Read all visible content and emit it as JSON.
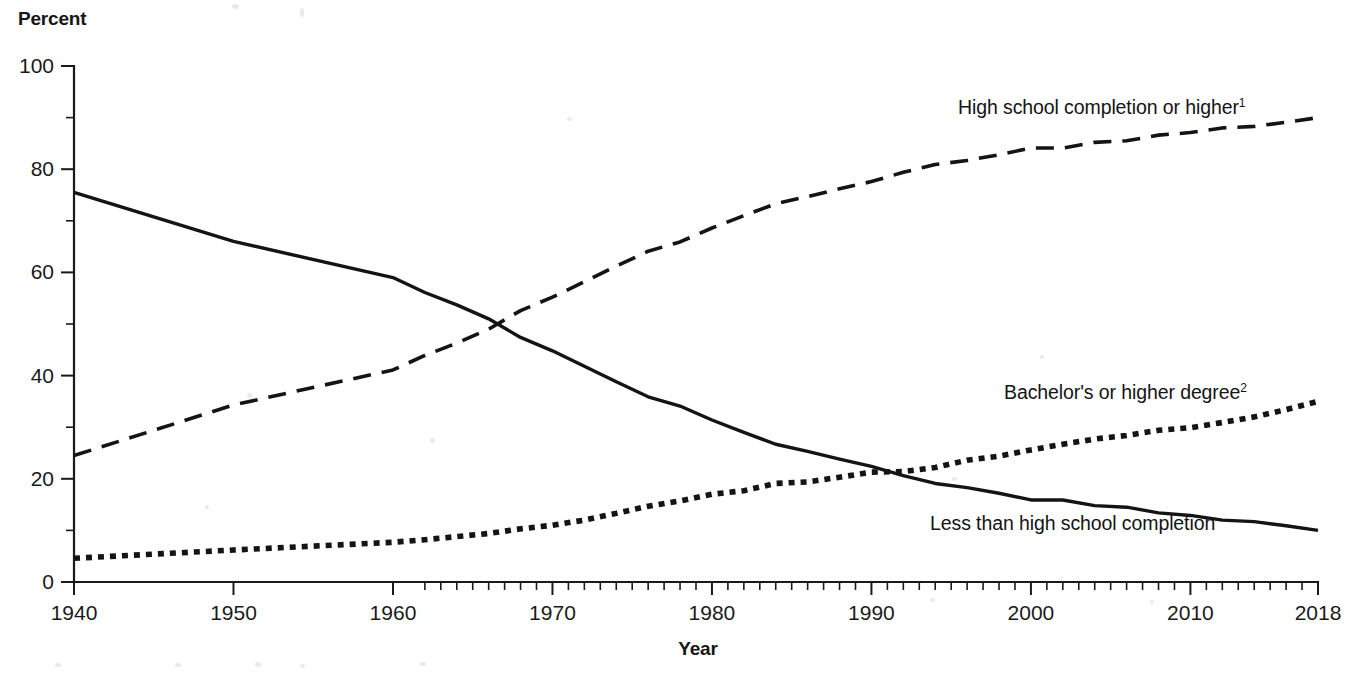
{
  "chart": {
    "type": "line",
    "title": "",
    "ylabel": "Percent",
    "xlabel": "Year",
    "ylim": [
      0,
      100
    ],
    "xlim": [
      1940,
      2018
    ],
    "grid": false,
    "legend_position": "inline-annotations",
    "y_ticks_major": [
      0,
      20,
      40,
      60,
      80,
      100
    ],
    "y_ticks_minor": [
      10,
      30,
      50,
      70,
      90
    ],
    "x_ticks_labeled": [
      1940,
      1950,
      1960,
      1970,
      1980,
      1990,
      2000,
      2010,
      2018
    ],
    "x_tick_note": "decennial ticks 1940-1960, annual ticks 1962-2018"
  },
  "axis_labels": {
    "y_title": "Percent",
    "x_title": "Year",
    "y_tick_text": [
      "100",
      "80",
      "60",
      "40",
      "20",
      "0"
    ],
    "x_tick_text": [
      "1940",
      "1950",
      "1960",
      "1970",
      "1980",
      "1990",
      "2000",
      "2010",
      "2018"
    ]
  },
  "annotations": [
    {
      "id": "hs-completion",
      "text": "High school completion or higher",
      "superscript": "1",
      "x_px": 958,
      "y_px": 96
    },
    {
      "id": "bachelors",
      "text": "Bachelor's or higher degree",
      "superscript": "2",
      "x_px": 1004,
      "y_px": 381
    },
    {
      "id": "less-than-hs",
      "text": "Less than high school completion",
      "superscript": "",
      "x_px": 930,
      "y_px": 512
    }
  ],
  "chart_data": {
    "type": "line",
    "title": "",
    "xlabel": "Year",
    "ylabel": "Percent",
    "ylim": [
      0,
      100
    ],
    "xlim": [
      1940,
      2018
    ],
    "grid": false,
    "legend_position": "inline-annotations",
    "x_tick_labels": [
      "1940",
      "1950",
      "1960",
      "1970",
      "1980",
      "1990",
      "2000",
      "2010",
      "2018"
    ],
    "y_tick_labels": [
      "0",
      "20",
      "40",
      "60",
      "80",
      "100"
    ],
    "series": [
      {
        "name": "High school completion or higher",
        "footnote": "1",
        "style": "dashed",
        "x": [
          1940,
          1950,
          1960,
          1962,
          1964,
          1966,
          1968,
          1970,
          1972,
          1974,
          1976,
          1978,
          1980,
          1982,
          1984,
          1986,
          1988,
          1990,
          1992,
          1994,
          1996,
          1998,
          2000,
          2002,
          2004,
          2006,
          2008,
          2010,
          2012,
          2014,
          2016,
          2018
        ],
        "values": [
          24.5,
          34.3,
          41.1,
          43.9,
          46.3,
          49.0,
          52.6,
          55.2,
          58.2,
          61.2,
          64.1,
          65.9,
          68.6,
          71.0,
          73.3,
          74.7,
          76.2,
          77.6,
          79.4,
          80.9,
          81.7,
          82.8,
          84.1,
          84.1,
          85.2,
          85.5,
          86.6,
          87.1,
          88.0,
          88.3,
          89.1,
          90.0
        ]
      },
      {
        "name": "Bachelor's or higher degree",
        "footnote": "2",
        "style": "dotted",
        "x": [
          1940,
          1950,
          1960,
          1962,
          1964,
          1966,
          1968,
          1970,
          1972,
          1974,
          1976,
          1978,
          1980,
          1982,
          1984,
          1986,
          1988,
          1990,
          1992,
          1994,
          1996,
          1998,
          2000,
          2002,
          2004,
          2006,
          2008,
          2010,
          2012,
          2014,
          2016,
          2018
        ],
        "values": [
          4.6,
          6.2,
          7.7,
          8.2,
          8.8,
          9.4,
          10.3,
          11.0,
          12.0,
          13.3,
          14.7,
          15.7,
          17.0,
          17.7,
          19.1,
          19.4,
          20.3,
          21.3,
          21.4,
          22.2,
          23.6,
          24.4,
          25.6,
          26.7,
          27.7,
          28.4,
          29.4,
          29.9,
          30.9,
          32.0,
          33.4,
          35.0
        ]
      },
      {
        "name": "Less than high school completion",
        "footnote": "",
        "style": "solid",
        "x": [
          1940,
          1950,
          1960,
          1962,
          1964,
          1966,
          1968,
          1970,
          1972,
          1974,
          1976,
          1978,
          1980,
          1982,
          1984,
          1986,
          1988,
          1990,
          1992,
          1994,
          1996,
          1998,
          2000,
          2002,
          2004,
          2006,
          2008,
          2010,
          2012,
          2014,
          2016,
          2018
        ],
        "values": [
          75.5,
          66.0,
          59.0,
          56.1,
          53.7,
          51.0,
          47.4,
          44.8,
          41.8,
          38.8,
          35.9,
          34.1,
          31.4,
          29.0,
          26.7,
          25.3,
          23.8,
          22.4,
          20.6,
          19.1,
          18.3,
          17.2,
          15.9,
          15.9,
          14.8,
          14.5,
          13.4,
          12.9,
          12.0,
          11.7,
          10.9,
          10.0
        ]
      }
    ]
  }
}
